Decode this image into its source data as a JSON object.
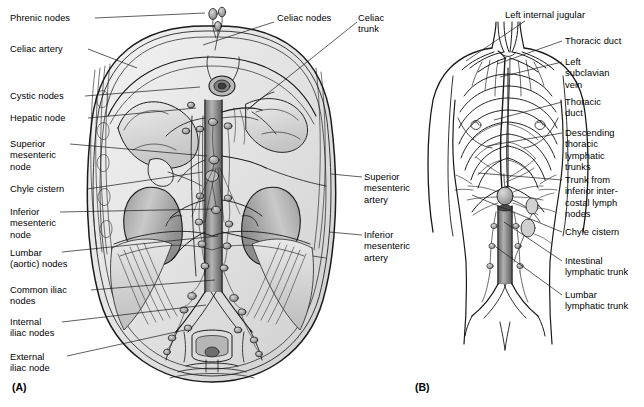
{
  "figure": {
    "panels": [
      {
        "id": "A",
        "caption": "(A)",
        "caption_pos": [
          12,
          381
        ],
        "description": "Abdominal cavity viewed from front showing aorta, kidneys and the lumbar chain of lymph nodes",
        "labels": [
          {
            "name": "phrenic-nodes",
            "text": "Phrenic nodes",
            "x": 10,
            "y": 13,
            "align": "left",
            "leader": [
              [
                95,
                18
              ],
              [
                205,
                13
              ]
            ]
          },
          {
            "name": "celiac-artery",
            "text": "Celiac artery",
            "x": 10,
            "y": 44,
            "align": "left",
            "leader": [
              [
                88,
                49
              ],
              [
                137,
                68
              ]
            ]
          },
          {
            "name": "cystic-nodes",
            "text": "Cystic nodes",
            "x": 10,
            "y": 91,
            "align": "left",
            "leader": [
              [
                85,
                96
              ],
              [
                200,
                87
              ]
            ]
          },
          {
            "name": "hepatic-node",
            "text": "Hepatic node",
            "x": 10,
            "y": 113,
            "align": "left",
            "leader": [
              [
                88,
                118
              ],
              [
                196,
                108
              ]
            ]
          },
          {
            "name": "superior-mesenteric-node",
            "text": "Superior\nmesenteric\nnode",
            "x": 10,
            "y": 139,
            "align": "left",
            "leader": [
              [
                70,
                144
              ],
              [
                207,
                156
              ]
            ]
          },
          {
            "name": "chyle-cistern",
            "text": "Chyle cistern",
            "x": 10,
            "y": 184,
            "align": "left",
            "leader": [
              [
                87,
                189
              ],
              [
                203,
                172
              ]
            ]
          },
          {
            "name": "inferior-mesenteric-node",
            "text": "Inferior\nmesenteric\nnode",
            "x": 10,
            "y": 207,
            "align": "left",
            "leader": [
              [
                60,
                212
              ],
              [
                214,
                209
              ]
            ]
          },
          {
            "name": "lumbar-aortic-nodes",
            "text": "Lumbar\n(aortic) nodes",
            "x": 10,
            "y": 248,
            "align": "left",
            "leader": [
              [
                62,
                252
              ],
              [
                218,
                236
              ]
            ]
          },
          {
            "name": "common-iliac-nodes",
            "text": "Common iliac\nnodes",
            "x": 10,
            "y": 285,
            "align": "left",
            "leader": [
              [
                91,
                290
              ],
              [
                215,
                280
              ]
            ]
          },
          {
            "name": "internal-iliac-nodes",
            "text": "Internal\niliac nodes",
            "x": 10,
            "y": 317,
            "align": "left",
            "leader": [
              [
                62,
                322
              ],
              [
                206,
                305
              ]
            ]
          },
          {
            "name": "external-iliac-node",
            "text": "External\niliac node",
            "x": 10,
            "y": 352,
            "align": "left",
            "leader": [
              [
                67,
                356
              ],
              [
                185,
                330
              ]
            ]
          },
          {
            "name": "celiac-nodes",
            "text": "Celiac nodes",
            "x": 277,
            "y": 13,
            "align": "left",
            "leader": [
              [
                274,
                22
              ],
              [
                203,
                45
              ]
            ]
          },
          {
            "name": "celiac-trunk",
            "text": "Celiac\ntrunk",
            "x": 358,
            "y": 13,
            "align": "left",
            "leader": [
              [
                357,
                22
              ],
              [
                247,
                110
              ]
            ]
          },
          {
            "name": "superior-mesenteric-artery",
            "text": "Superior\nmesenteric\nartery",
            "x": 364,
            "y": 172,
            "align": "left",
            "leader": [
              [
                362,
                177
              ],
              [
                331,
                174
              ]
            ]
          },
          {
            "name": "inferior-mesenteric-artery",
            "text": "Inferior\nmesenteric\nartery",
            "x": 364,
            "y": 230,
            "align": "left",
            "leader": [
              [
                362,
                235
              ],
              [
                329,
                232
              ]
            ]
          }
        ]
      },
      {
        "id": "B",
        "caption": "(B)",
        "caption_pos": [
          415,
          381
        ],
        "description": "Whole-torso line drawing showing the thoracic duct and its tributaries",
        "labels": [
          {
            "name": "left-internal-jugular",
            "text": "Left internal jugular",
            "x": 505,
            "y": 10,
            "align": "left",
            "leader": [
              [
                525,
                21
              ],
              [
                466,
                61
              ]
            ]
          },
          {
            "name": "thoracic-duct-upper",
            "text": "Thoracic duct",
            "x": 565,
            "y": 36,
            "align": "left",
            "leader": [
              [
                562,
                41
              ],
              [
                497,
                64
              ]
            ]
          },
          {
            "name": "left-subclavian-vein",
            "text": "Left\nsubclavian\nvein",
            "x": 565,
            "y": 57,
            "align": "left",
            "leader": [
              [
                562,
                62
              ],
              [
                500,
                77
              ]
            ]
          },
          {
            "name": "thoracic-duct-lower",
            "text": "Thoracic\nduct",
            "x": 565,
            "y": 97,
            "align": "left",
            "leader": [
              [
                562,
                102
              ],
              [
                494,
                120
              ]
            ]
          },
          {
            "name": "descending-thoracic-lymphatic-trunks",
            "text": "Descending\nthoracic\nlymphatic\ntrunks",
            "x": 565,
            "y": 128,
            "align": "left",
            "leader": [
              [
                562,
                133
              ],
              [
                487,
                146
              ]
            ]
          },
          {
            "name": "trunk-inferior-intercostal",
            "text": "Trunk from\ninferior inter-\ncostal lymph\nnodes",
            "x": 565,
            "y": 175,
            "align": "left",
            "leader": [
              [
                562,
                180
              ],
              [
                478,
                173
              ]
            ]
          },
          {
            "name": "chyle-cistern-b",
            "text": "Chyle cistern",
            "x": 565,
            "y": 227,
            "align": "left",
            "leader": [
              [
                562,
                232
              ],
              [
                472,
                195
              ]
            ]
          },
          {
            "name": "intestinal-lymphatic-trunk",
            "text": "Intestinal\nlymphatic trunk",
            "x": 565,
            "y": 256,
            "align": "left",
            "leader": [
              [
                562,
                261
              ],
              [
                504,
                222
              ]
            ]
          },
          {
            "name": "lumbar-lymphatic-trunk",
            "text": "Lumbar\nlymphatic trunk",
            "x": 565,
            "y": 290,
            "align": "left",
            "leader": [
              [
                562,
                295
              ],
              [
                496,
                247
              ]
            ]
          }
        ]
      }
    ]
  }
}
